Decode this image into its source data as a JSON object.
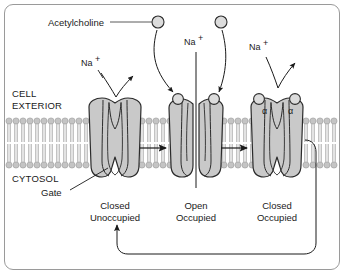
{
  "figure": {
    "ligand_label": "Acetylcholine",
    "ion_label": "Na",
    "ion_charge": "+",
    "subunit_label": "α",
    "gate_label": "Gate",
    "compartments": {
      "exterior_line1": "CELL",
      "exterior_line2": "EXTERIOR",
      "cytosol": "CYTOSOL"
    }
  },
  "states": [
    {
      "id": "closed-unoccupied",
      "line1": "Closed",
      "line2": "Unoccupied",
      "bound_ligands": 0,
      "pore_open": false,
      "cx": 115
    },
    {
      "id": "open-occupied",
      "line1": "Open",
      "line2": "Occupied",
      "bound_ligands": 2,
      "pore_open": true,
      "cx": 196
    },
    {
      "id": "closed-occupied",
      "line1": "Closed",
      "line2": "Occupied",
      "bound_ligands": 2,
      "pore_open": false,
      "cx": 277
    }
  ],
  "free_ligands": [
    {
      "id": "ligand-left",
      "cx": 158,
      "cy": 22
    },
    {
      "id": "ligand-right",
      "cx": 221,
      "cy": 22
    }
  ],
  "ion_labels": [
    {
      "id": "na-left",
      "x": 86,
      "y": 64
    },
    {
      "id": "na-middle",
      "x": 188,
      "y": 43
    },
    {
      "id": "na-right",
      "x": 253,
      "y": 48
    }
  ],
  "colors": {
    "protein_fill": "#c9c9c9",
    "protein_stroke": "#2b2b2b",
    "membrane_head": "#c4c4c4",
    "membrane_tail": "#bdbdbd",
    "ligand_fill": "#dcdcdc",
    "frame_border": "#9a9a9a",
    "text": "#1a1a1a",
    "arrow": "#1a1a1a"
  },
  "membrane": {
    "top_y": 118,
    "bottom_y": 168
  }
}
